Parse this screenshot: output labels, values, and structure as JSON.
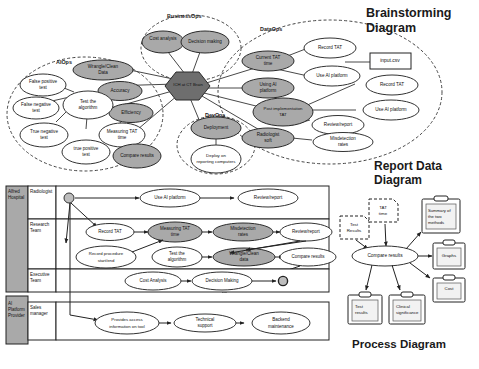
{
  "titles": {
    "brainstorming": "Brainstorming Diagram",
    "report": "Report Data Diagram",
    "process": "Process Diagram"
  },
  "brainstorming": {
    "center": "ICH at CT Brain",
    "groups": [
      {
        "name": "BusinessOps"
      },
      {
        "name": "DataOps"
      },
      {
        "name": "AIOps"
      },
      {
        "name": "DevOps"
      }
    ],
    "nodes": [
      {
        "label": "Cost analysis",
        "shade": "dark",
        "group": "BusinessOps"
      },
      {
        "label": "Decision making",
        "shade": "dark",
        "group": "BusinessOps"
      },
      {
        "label": "Current TAT time",
        "shade": "dark",
        "group": "DataOps"
      },
      {
        "label": "Record TAT",
        "shade": "light",
        "group": "DataOps"
      },
      {
        "label": "Use AI platform",
        "shade": "light",
        "group": "DataOps"
      },
      {
        "label": "Using AI platform",
        "shade": "dark",
        "group": "DataOps"
      },
      {
        "label": "Record TAT",
        "shade": "light",
        "group": "DataOps"
      },
      {
        "label": "Post implementation TAT",
        "shade": "dark",
        "group": "DataOps"
      },
      {
        "label": "Use AI platform",
        "shade": "light",
        "group": "DataOps"
      },
      {
        "label": "Review/report",
        "shade": "light",
        "group": "DataOps"
      },
      {
        "label": "Radiologist soft",
        "shade": "dark",
        "group": "DataOps"
      },
      {
        "label": "Misdetection rates",
        "shade": "light",
        "group": "DataOps"
      },
      {
        "label": "Wrangle/Clean Data",
        "shade": "dark",
        "group": "AIOps"
      },
      {
        "label": "Accuracy",
        "shade": "dark",
        "group": "AIOps"
      },
      {
        "label": "Efficiency",
        "shade": "dark",
        "group": "AIOps"
      },
      {
        "label": "False positive test",
        "shade": "light",
        "group": "AIOps"
      },
      {
        "label": "False negative test",
        "shade": "light",
        "group": "AIOps"
      },
      {
        "label": "True negative test",
        "shade": "light",
        "group": "AIOps"
      },
      {
        "label": "true positive test",
        "shade": "light",
        "group": "AIOps"
      },
      {
        "label": "Test the algorithm",
        "shade": "light",
        "group": "AIOps"
      },
      {
        "label": "Measuring TAT time",
        "shade": "light",
        "group": "AIOps"
      },
      {
        "label": "Compare results",
        "shade": "dark",
        "group": "AIOps"
      },
      {
        "label": "Deployment",
        "shade": "dark",
        "group": "DevOps"
      },
      {
        "label": "Deploy on reporting computers",
        "shade": "light",
        "group": "DevOps"
      }
    ],
    "file_box": "input.csv"
  },
  "process": {
    "pools": [
      {
        "name": "Alfred Hospital",
        "lanes": [
          "Radiologist",
          "Research Team",
          "Executive Team"
        ]
      },
      {
        "name": "AI Platform Provider",
        "lanes": [
          "Sales manager"
        ]
      }
    ],
    "lane_radiologist": [
      "Use AI platform",
      "Review/report"
    ],
    "lane_research_row1": [
      "Record TAT",
      "Measuring TAT time",
      "Misdetection rates",
      "Review/report"
    ],
    "lane_research_row2": [
      "Record procedure start/end",
      "Test the algorithm",
      "Wrangle/Clean data",
      "Compare results"
    ],
    "lane_executive": [
      "Cost Analysis",
      "Decision Making"
    ],
    "lane_sales": [
      "Provides access information on tool",
      "Technical support",
      "Backend maintenance"
    ]
  },
  "report": {
    "inputs": [
      "Test Results",
      "TAT time"
    ],
    "center": "Compare results",
    "outputs_right": [
      "Summary of the two methods",
      "Graphs",
      "Cost"
    ],
    "outputs_bottom": [
      "Test results",
      "Clinical significance"
    ]
  },
  "colors": {
    "shaded_node": "#a9a9a9",
    "center_hex": "#6e6e6e",
    "pool_band": "#a9a9a9",
    "stroke": "#222222"
  }
}
